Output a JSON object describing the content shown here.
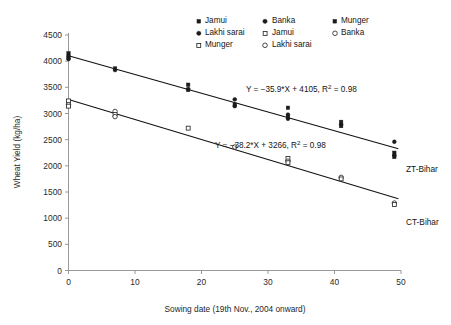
{
  "chart_data": {
    "type": "scatter",
    "title": "",
    "xlabel": "Sowing date (19th Nov., 2004 onward)",
    "ylabel": "Wheat Yield (kg/ha)",
    "xlim": [
      0,
      50
    ],
    "ylim": [
      0,
      4500
    ],
    "xticks": [
      0,
      10,
      20,
      30,
      40,
      50
    ],
    "yticks": [
      0,
      500,
      1000,
      1500,
      2000,
      2500,
      3000,
      3500,
      4000,
      4500
    ],
    "grid": false,
    "legend_position": "top-center",
    "legend": [
      {
        "label": "Jamui",
        "marker": "filled-square",
        "group": "ZT-Bihar"
      },
      {
        "label": "Banka",
        "marker": "filled-circle",
        "group": "ZT-Bihar"
      },
      {
        "label": "Munger",
        "marker": "filled-square",
        "group": "ZT-Bihar"
      },
      {
        "label": "Lakhi sarai",
        "marker": "filled-circle",
        "group": "ZT-Bihar"
      },
      {
        "label": "Jamui",
        "marker": "open-square",
        "group": "CT-Bihar"
      },
      {
        "label": "Banka",
        "marker": "open-circle",
        "group": "CT-Bihar"
      },
      {
        "label": "Munger",
        "marker": "open-square",
        "group": "CT-Bihar"
      },
      {
        "label": "Lakhi sarai",
        "marker": "open-circle",
        "group": "CT-Bihar"
      }
    ],
    "series": [
      {
        "name": "ZT-Bihar",
        "marker": "filled",
        "end_label": "ZT-Bihar",
        "fit": {
          "slope": -35.9,
          "intercept": 4105,
          "r2": 0.98,
          "text": "Y = −35.9*X + 4105, R² = 0.98"
        },
        "points": [
          {
            "x": 0,
            "y": 4150,
            "site": "Jamui"
          },
          {
            "x": 0,
            "y": 4100,
            "site": "Banka"
          },
          {
            "x": 0,
            "y": 4060,
            "site": "Munger"
          },
          {
            "x": 0,
            "y": 4040,
            "site": "Lakhi sarai"
          },
          {
            "x": 7,
            "y": 3860,
            "site": "Jamui"
          },
          {
            "x": 7,
            "y": 3830,
            "site": "Banka"
          },
          {
            "x": 18,
            "y": 3550,
            "site": "Jamui"
          },
          {
            "x": 18,
            "y": 3470,
            "site": "Banka"
          },
          {
            "x": 18,
            "y": 3450,
            "site": "Munger"
          },
          {
            "x": 25,
            "y": 3270,
            "site": "Jamui"
          },
          {
            "x": 25,
            "y": 3170,
            "site": "Banka"
          },
          {
            "x": 25,
            "y": 3140,
            "site": "Munger"
          },
          {
            "x": 33,
            "y": 3110,
            "site": "Jamui"
          },
          {
            "x": 33,
            "y": 2980,
            "site": "Banka"
          },
          {
            "x": 33,
            "y": 2930,
            "site": "Munger"
          },
          {
            "x": 33,
            "y": 2900,
            "site": "Lakhi sarai"
          },
          {
            "x": 41,
            "y": 2840,
            "site": "Jamui"
          },
          {
            "x": 41,
            "y": 2790,
            "site": "Banka"
          },
          {
            "x": 41,
            "y": 2760,
            "site": "Munger"
          },
          {
            "x": 49,
            "y": 2460,
            "site": "Jamui"
          },
          {
            "x": 49,
            "y": 2250,
            "site": "Banka"
          },
          {
            "x": 49,
            "y": 2200,
            "site": "Munger"
          },
          {
            "x": 49,
            "y": 2170,
            "site": "Lakhi sarai"
          }
        ]
      },
      {
        "name": "CT-Bihar",
        "marker": "open",
        "end_label": "CT-Bihar",
        "fit": {
          "slope": -38.2,
          "intercept": 3266,
          "r2": 0.98,
          "text": "Y = −38.2*X + 3266, R² = 0.98"
        },
        "points": [
          {
            "x": 0,
            "y": 3240,
            "site": "Jamui"
          },
          {
            "x": 0,
            "y": 3170,
            "site": "Banka"
          },
          {
            "x": 0,
            "y": 3140,
            "site": "Munger"
          },
          {
            "x": 7,
            "y": 3040,
            "site": "Jamui"
          },
          {
            "x": 7,
            "y": 2980,
            "site": "Banka"
          },
          {
            "x": 7,
            "y": 2940,
            "site": "Munger"
          },
          {
            "x": 18,
            "y": 2720,
            "site": "Jamui"
          },
          {
            "x": 25,
            "y": 2360,
            "site": "Jamui"
          },
          {
            "x": 33,
            "y": 2140,
            "site": "Jamui"
          },
          {
            "x": 33,
            "y": 2090,
            "site": "Banka"
          },
          {
            "x": 33,
            "y": 2060,
            "site": "Munger"
          },
          {
            "x": 41,
            "y": 1780,
            "site": "Jamui"
          },
          {
            "x": 41,
            "y": 1750,
            "site": "Banka"
          },
          {
            "x": 49,
            "y": 1290,
            "site": "Jamui"
          },
          {
            "x": 49,
            "y": 1260,
            "site": "Banka"
          }
        ]
      }
    ]
  },
  "colors": {
    "marker_fill": "#1b1b1b",
    "marker_open": "#ffffff",
    "line": "#111111",
    "axis": "#8d8d8d",
    "text": "#1a1a1a",
    "background": "#ffffff"
  }
}
